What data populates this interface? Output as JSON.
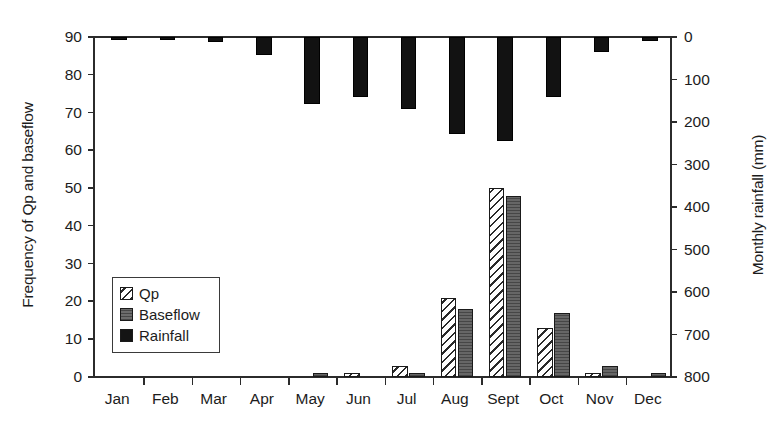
{
  "chart_data": {
    "type": "bar",
    "title": "",
    "subtitle": "",
    "categories": [
      "Jan",
      "Feb",
      "Mar",
      "Apr",
      "May",
      "Jun",
      "Jul",
      "Aug",
      "Sept",
      "Oct",
      "Nov",
      "Dec"
    ],
    "xlabel": "",
    "ylabel": "Frequency of Qp and baseflow",
    "y2label": "Monthly rainfall (mm)",
    "ylim": [
      0,
      90
    ],
    "y2lim": [
      0,
      800
    ],
    "y2_inverted": true,
    "yticks": [
      0,
      10,
      20,
      30,
      40,
      50,
      60,
      70,
      80,
      90
    ],
    "y2ticks": [
      0,
      100,
      200,
      300,
      400,
      500,
      600,
      700,
      800
    ],
    "grid": false,
    "legend_position": "inner-left",
    "series": [
      {
        "name": "Qp",
        "axis": "left",
        "style": "white-diagonal-hatch",
        "color": "#ffffff",
        "values": [
          0,
          0,
          0,
          0,
          0,
          1,
          3,
          21,
          50,
          13,
          1,
          0
        ]
      },
      {
        "name": "Baseflow",
        "axis": "left",
        "style": "solid-gray",
        "color": "#555555",
        "values": [
          0,
          0,
          0,
          0,
          1,
          0,
          1,
          18,
          48,
          17,
          3,
          1
        ]
      },
      {
        "name": "Rainfall",
        "axis": "right-inverted",
        "style": "solid-black",
        "color": "#121212",
        "values": [
          5,
          5,
          12,
          42,
          158,
          140,
          170,
          228,
          245,
          142,
          35,
          10
        ]
      }
    ]
  },
  "legend": {
    "items": [
      {
        "label": "Qp",
        "swatch": "qp-hatch-swatch"
      },
      {
        "label": "Baseflow",
        "swatch": "baseflow-gray-swatch"
      },
      {
        "label": "Rainfall",
        "swatch": "rainfall-black-swatch"
      }
    ]
  }
}
